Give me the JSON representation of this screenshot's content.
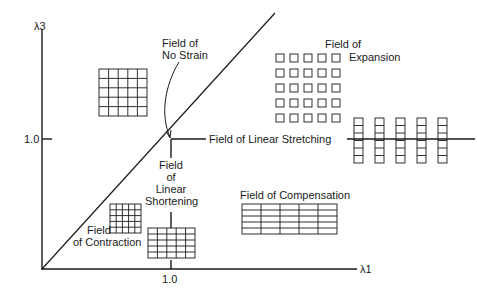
{
  "axes": {
    "y_label": "λ3",
    "x_label": "λ1",
    "y_tick": "1.0",
    "x_tick": "1.0"
  },
  "fields": {
    "no_strain": [
      "Field of",
      "No Strain"
    ],
    "expansion": [
      "Field of",
      "Expansion"
    ],
    "linear_stretching": "Field of Linear Stretching",
    "linear_shortening": [
      "Field",
      "of",
      "Linear",
      "Shortening"
    ],
    "compensation": "Field of Compensation",
    "contraction": [
      "Field",
      "of Contraction"
    ]
  }
}
